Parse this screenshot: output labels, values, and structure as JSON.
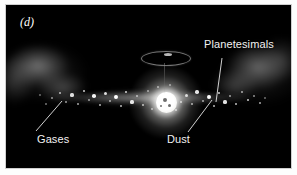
{
  "figure": {
    "panel_letter": "(d)",
    "background_color": "#000000",
    "border_color": "#ffffff",
    "label_color": "#f2f2f2"
  },
  "labels": {
    "planetesimals": "Planetesimals",
    "gases": "Gases",
    "dust": "Dust"
  },
  "scene": {
    "star_name": "protostar",
    "ring_name": "accretion-ring",
    "disk_name": "dust-disk",
    "gas_left_name": "gas-cloud-left",
    "gas_right_name": "gas-cloud-right"
  },
  "specks": [
    {
      "x": 46,
      "y": 93,
      "r": 1.0,
      "o": 0.55
    },
    {
      "x": 54,
      "y": 88,
      "r": 1.3,
      "o": 0.7
    },
    {
      "x": 60,
      "y": 97,
      "r": 1.0,
      "o": 0.6
    },
    {
      "x": 66,
      "y": 90,
      "r": 1.6,
      "o": 0.85
    },
    {
      "x": 72,
      "y": 99,
      "r": 1.1,
      "o": 0.65
    },
    {
      "x": 78,
      "y": 86,
      "r": 1.4,
      "o": 0.8
    },
    {
      "x": 83,
      "y": 95,
      "r": 1.0,
      "o": 0.58
    },
    {
      "x": 88,
      "y": 91,
      "r": 1.8,
      "o": 0.95
    },
    {
      "x": 94,
      "y": 100,
      "r": 1.2,
      "o": 0.7
    },
    {
      "x": 99,
      "y": 88,
      "r": 1.5,
      "o": 0.85
    },
    {
      "x": 104,
      "y": 96,
      "r": 1.1,
      "o": 0.62
    },
    {
      "x": 110,
      "y": 92,
      "r": 1.9,
      "o": 1.0
    },
    {
      "x": 115,
      "y": 101,
      "r": 1.2,
      "o": 0.72
    },
    {
      "x": 120,
      "y": 87,
      "r": 1.4,
      "o": 0.82
    },
    {
      "x": 126,
      "y": 97,
      "r": 1.6,
      "o": 0.9
    },
    {
      "x": 131,
      "y": 91,
      "r": 1.1,
      "o": 0.66
    },
    {
      "x": 137,
      "y": 100,
      "r": 1.3,
      "o": 0.76
    },
    {
      "x": 142,
      "y": 86,
      "r": 1.0,
      "o": 0.58
    },
    {
      "x": 180,
      "y": 90,
      "r": 1.5,
      "o": 0.86
    },
    {
      "x": 186,
      "y": 99,
      "r": 1.2,
      "o": 0.7
    },
    {
      "x": 191,
      "y": 87,
      "r": 1.7,
      "o": 0.92
    },
    {
      "x": 197,
      "y": 96,
      "r": 1.1,
      "o": 0.64
    },
    {
      "x": 203,
      "y": 92,
      "r": 1.9,
      "o": 1.0
    },
    {
      "x": 208,
      "y": 101,
      "r": 1.2,
      "o": 0.72
    },
    {
      "x": 213,
      "y": 88,
      "r": 1.4,
      "o": 0.82
    },
    {
      "x": 219,
      "y": 97,
      "r": 1.6,
      "o": 0.88
    },
    {
      "x": 224,
      "y": 91,
      "r": 1.0,
      "o": 0.6
    },
    {
      "x": 230,
      "y": 99,
      "r": 1.3,
      "o": 0.75
    },
    {
      "x": 236,
      "y": 87,
      "r": 1.1,
      "o": 0.64
    },
    {
      "x": 242,
      "y": 95,
      "r": 1.4,
      "o": 0.8
    },
    {
      "x": 248,
      "y": 91,
      "r": 1.0,
      "o": 0.56
    },
    {
      "x": 254,
      "y": 98,
      "r": 1.2,
      "o": 0.66
    },
    {
      "x": 40,
      "y": 99,
      "r": 0.9,
      "o": 0.45
    },
    {
      "x": 152,
      "y": 82,
      "r": 1.1,
      "o": 0.6
    },
    {
      "x": 170,
      "y": 105,
      "r": 1.2,
      "o": 0.68
    },
    {
      "x": 164,
      "y": 80,
      "r": 1.0,
      "o": 0.55
    },
    {
      "x": 146,
      "y": 104,
      "r": 1.1,
      "o": 0.62
    },
    {
      "x": 259,
      "y": 93,
      "r": 0.9,
      "o": 0.42
    },
    {
      "x": 34,
      "y": 90,
      "r": 0.9,
      "o": 0.4
    },
    {
      "x": 175,
      "y": 97,
      "r": 1.3,
      "o": 0.74
    }
  ],
  "starspots": [
    {
      "x": 157,
      "y": 93,
      "w": 4,
      "h": 4
    },
    {
      "x": 162,
      "y": 99,
      "w": 3,
      "h": 3
    },
    {
      "x": 154,
      "y": 100,
      "w": 2,
      "h": 2
    }
  ],
  "leader_lines": [
    {
      "name": "planetesimals-leader",
      "x1": 216,
      "y1": 53,
      "x2": 210,
      "y2": 97
    },
    {
      "name": "gases-leader",
      "x1": 30,
      "y1": 126,
      "x2": 56,
      "y2": 96
    },
    {
      "name": "dust-leader",
      "x1": 182,
      "y1": 127,
      "x2": 206,
      "y2": 95
    }
  ]
}
